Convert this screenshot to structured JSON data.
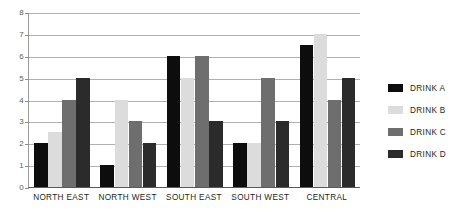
{
  "chart_data": {
    "type": "bar",
    "title": "",
    "subtitle": "",
    "xlabel": "",
    "ylabel": "",
    "ylim": [
      0,
      8
    ],
    "y_ticks": [
      "0",
      "1",
      "2",
      "3",
      "4",
      "5",
      "6",
      "7",
      "8"
    ],
    "grid": true,
    "legend_position": "right",
    "categories": [
      "NORTH EAST",
      "NORTH WEST",
      "SOUTH EAST",
      "SOUTH WEST",
      "CENTRAL"
    ],
    "series": [
      {
        "name": "DRINK A",
        "color": "#0d0d0d",
        "values": [
          2,
          1,
          6,
          2,
          6.5
        ]
      },
      {
        "name": "DRINK B",
        "color": "#dcdcdc",
        "values": [
          2.5,
          4,
          5,
          2,
          7
        ]
      },
      {
        "name": "DRINK C",
        "color": "#6e6e6e",
        "values": [
          4,
          3,
          6,
          5,
          4
        ]
      },
      {
        "name": "DRINK D",
        "color": "#2b2b2b",
        "values": [
          5,
          2,
          3,
          3,
          5
        ]
      }
    ]
  },
  "legend": {
    "items": [
      {
        "label": "DRINK A",
        "color": "#0d0d0d"
      },
      {
        "label": "DRINK B",
        "color": "#dcdcdc"
      },
      {
        "label": "DRINK C",
        "color": "#6e6e6e"
      },
      {
        "label": "DRINK D",
        "color": "#2b2b2b"
      }
    ]
  },
  "colors": {
    "background": "#ffffff",
    "gridline": "#b0b0b0",
    "axis": "#5a5a5a",
    "tick_text": "#5b5b5b",
    "label_text": "#231f20"
  }
}
